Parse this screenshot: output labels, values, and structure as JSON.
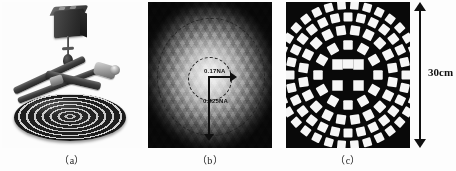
{
  "figure": {
    "background_color": "#fdfdfd",
    "width": 456,
    "height": 171
  },
  "panels": [
    {
      "id": "a",
      "caption": "（a）",
      "title": "measurement-apparatus-photograph",
      "description": "Photograph of a dark cube camera mounted on a vertical post above an elliptical concentric-ring calibration disc, with two angled metal arms crossing above it.",
      "components": [
        {
          "name": "camera-body",
          "color": "#2b2b2b"
        },
        {
          "name": "mounting-post",
          "color": "#3b3b3b"
        },
        {
          "name": "probe-arm",
          "color": "#3f3f3f"
        },
        {
          "name": "ring-target-disc",
          "color": "#1f1f1f"
        }
      ]
    },
    {
      "id": "b",
      "caption": "（b）",
      "title": "illumination-na-map",
      "description": "Faceted speckle illumination intensity map with dashed numerical-aperture circles and radius arrows.",
      "annotations": {
        "inner_na_label": "0.17NA",
        "outer_na_label": "0.425NA"
      },
      "colors": {
        "background": "#0c0c0c",
        "core": "#f4f4f4",
        "annotation": "#101010"
      }
    },
    {
      "id": "c",
      "caption": "（c）",
      "title": "circular-checkerboard-calibration-target",
      "description": "Binary circular calibration target: a central checkerboard cluster surrounded by four concentric rings of white square tiles on a black field.",
      "rings": [
        {
          "index": 1,
          "tile_count": 12
        },
        {
          "index": 2,
          "tile_count": 20
        },
        {
          "index": 3,
          "tile_count": 28
        },
        {
          "index": 4,
          "tile_count": 34
        }
      ],
      "colors": {
        "background": "#090909",
        "tiles": "#f6f6f6"
      }
    }
  ],
  "scale_bar": {
    "label": "30cm",
    "orientation": "vertical",
    "arrow_heads": "both",
    "color": "#111111"
  },
  "chart_data": {
    "type": "heatmap",
    "subplots": [
      "（a）",
      "（b）",
      "（c）"
    ],
    "annotations": [
      "0.17NA",
      "0.425NA",
      "30cm"
    ],
    "xlabel": "",
    "ylabel": "",
    "grid": false,
    "legend": "none"
  }
}
